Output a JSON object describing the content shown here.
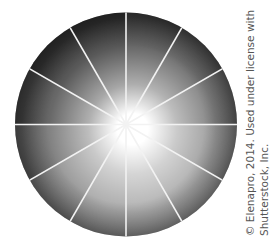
{
  "figure": {
    "type": "grayscale-value-wheel",
    "segments": 12,
    "segment_shades": [
      "#4a4a4a",
      "#555555",
      "#6a6a6a",
      "#8a8a8a",
      "#9c9c9c",
      "#a2a2a2",
      "#9a9a9a",
      "#888888",
      "#6c6c6c",
      "#4e4e4e",
      "#3c3c3c",
      "#3a3a3a"
    ],
    "center_color": "#ffffff",
    "divider_color": "#f2f2f2"
  },
  "credit": {
    "line1": "© Elenapro, 2014. Used under license with",
    "line2": "Shutterstock, Inc."
  }
}
